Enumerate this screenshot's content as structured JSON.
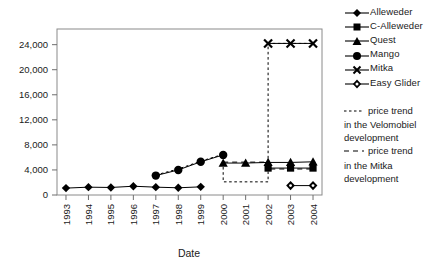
{
  "chart_data": {
    "type": "line",
    "title": "",
    "xlabel": "Date",
    "ylabel": "",
    "grid": false,
    "legend_position": "right",
    "x": [
      1993,
      1994,
      1995,
      1996,
      1997,
      1998,
      1999,
      2000,
      2001,
      2002,
      2003,
      2004
    ],
    "xtick_labels": [
      "1993",
      "1994",
      "1995",
      "1996",
      "1997",
      "1998",
      "1999",
      "2000",
      "2001",
      "2002",
      "2003",
      "2004"
    ],
    "ytick_labels": [
      "0",
      "4,000",
      "8,000",
      "12,000",
      "16,000",
      "20,000",
      "24,000"
    ],
    "ytick_values": [
      0,
      4000,
      8000,
      12000,
      16000,
      20000,
      24000
    ],
    "ylim": [
      0,
      26500
    ],
    "xlim": [
      1992.6,
      2004.4
    ],
    "series": [
      {
        "name": "Alleweder",
        "marker": "diamond",
        "points": [
          {
            "x": 1993,
            "y": 1100
          },
          {
            "x": 1994,
            "y": 1250
          },
          {
            "x": 1995,
            "y": 1200
          },
          {
            "x": 1996,
            "y": 1400
          },
          {
            "x": 1997,
            "y": 1250
          },
          {
            "x": 1998,
            "y": 1150
          },
          {
            "x": 1999,
            "y": 1300
          }
        ]
      },
      {
        "name": "C-Alleweder",
        "marker": "square",
        "points": [
          {
            "x": 2002,
            "y": 4300
          },
          {
            "x": 2003,
            "y": 4300
          },
          {
            "x": 2004,
            "y": 4300
          }
        ]
      },
      {
        "name": "Quest",
        "marker": "triangle",
        "points": [
          {
            "x": 2000,
            "y": 5100
          },
          {
            "x": 2001,
            "y": 5100
          },
          {
            "x": 2002,
            "y": 5200
          },
          {
            "x": 2003,
            "y": 5200
          },
          {
            "x": 2004,
            "y": 5300
          }
        ]
      },
      {
        "name": "Mango",
        "marker": "circle",
        "points": [
          {
            "x": 1997,
            "y": 3100
          },
          {
            "x": 1998,
            "y": 4000
          },
          {
            "x": 1999,
            "y": 5300
          },
          {
            "x": 2000,
            "y": 6400
          }
        ]
      },
      {
        "name": "Mitka",
        "marker": "cross",
        "points": [
          {
            "x": 2002,
            "y": 24200
          },
          {
            "x": 2003,
            "y": 24200
          },
          {
            "x": 2004,
            "y": 24200
          }
        ]
      },
      {
        "name": "Easy Glider",
        "marker": "diamond-dot",
        "points": [
          {
            "x": 2003,
            "y": 1500
          },
          {
            "x": 2004,
            "y": 1500
          }
        ]
      }
    ],
    "trend_lines": [
      {
        "name": "price trend in the Velomobiel development",
        "style": "dotted",
        "points": [
          {
            "x": 1997,
            "y": 3200
          },
          {
            "x": 1998,
            "y": 4150
          },
          {
            "x": 1999,
            "y": 5400
          },
          {
            "x": 2000,
            "y": 6500
          },
          {
            "x": 2000,
            "y": 2100
          },
          {
            "x": 2002,
            "y": 2100
          },
          {
            "x": 2002,
            "y": 24200
          },
          {
            "x": 2004,
            "y": 24200
          }
        ]
      },
      {
        "name": "price trend in the Mitka development",
        "style": "dashed",
        "points": [
          {
            "x": 2000,
            "y": 5250
          },
          {
            "x": 2002,
            "y": 5250
          },
          {
            "x": 2002,
            "y": 4150
          },
          {
            "x": 2004,
            "y": 4150
          }
        ]
      }
    ]
  },
  "legend": {
    "items": [
      {
        "label": "Alleweder",
        "marker": "diamond"
      },
      {
        "label": "C-Alleweder",
        "marker": "square"
      },
      {
        "label": "Quest",
        "marker": "triangle"
      },
      {
        "label": "Mango",
        "marker": "circle"
      },
      {
        "label": "Mitka",
        "marker": "cross"
      },
      {
        "label": "Easy Glider",
        "marker": "diamond-dot"
      }
    ]
  },
  "notes": {
    "velomobiel": [
      "price trend",
      "in the Velomobiel",
      "development"
    ],
    "mitka": [
      "price trend",
      "in the Mitka",
      "development"
    ]
  },
  "axes": {
    "x_title": "Date"
  },
  "colors": {
    "ink": "#1a1a1a",
    "axis": "#7a7a7a",
    "series": "#000000"
  }
}
